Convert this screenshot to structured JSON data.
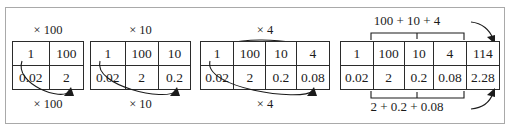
{
  "figure": {
    "caption_fragment": "",
    "border_color": "#a9a9a9",
    "ink_color": "#1b1b1b"
  },
  "groups": [
    {
      "id": "step-1",
      "top_label": "× 100",
      "bottom_label": "× 100",
      "rows": [
        [
          "1",
          "100"
        ],
        [
          "0.02",
          "2"
        ]
      ],
      "col_widths": [
        44,
        44
      ]
    },
    {
      "id": "step-2",
      "top_label": "× 10",
      "bottom_label": "× 10",
      "rows": [
        [
          "1",
          "100",
          "10"
        ],
        [
          "0.02",
          "2",
          "0.2"
        ]
      ],
      "col_widths": [
        33,
        33,
        33
      ]
    },
    {
      "id": "step-3",
      "top_label": "× 4",
      "bottom_label": "× 4",
      "rows": [
        [
          "1",
          "100",
          "10",
          "4"
        ],
        [
          "0.02",
          "2",
          "0.2",
          "0.08"
        ]
      ],
      "col_widths": [
        32,
        32,
        32,
        32
      ]
    },
    {
      "id": "step-4",
      "top_label": "100 + 10 + 4",
      "bottom_label": "2 + 0.2 + 0.08",
      "rows": [
        [
          "1",
          "100",
          "10",
          "4",
          "114"
        ],
        [
          "0.02",
          "2",
          "0.2",
          "0.08",
          "2.28"
        ]
      ],
      "col_widths": [
        31,
        31,
        31,
        31,
        32
      ]
    }
  ]
}
